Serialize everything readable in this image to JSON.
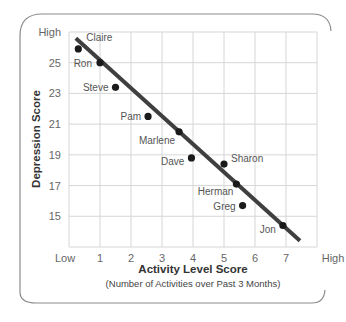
{
  "chart_data": {
    "type": "scatter",
    "title": "",
    "xlabel": "Activity Level Score",
    "xlabel_sub": "(Number of Activities over Past 3 Months)",
    "ylabel": "Depression Score",
    "x_ticks": [
      {
        "value": 0,
        "label": "Low"
      },
      {
        "value": 1,
        "label": "1"
      },
      {
        "value": 2,
        "label": "2"
      },
      {
        "value": 3,
        "label": "3"
      },
      {
        "value": 4,
        "label": "4"
      },
      {
        "value": 5,
        "label": "5"
      },
      {
        "value": 6,
        "label": "6"
      },
      {
        "value": 7,
        "label": "7"
      },
      {
        "value": 8,
        "label": "High"
      }
    ],
    "y_ticks": [
      {
        "value": 15,
        "label": "15"
      },
      {
        "value": 17,
        "label": "17"
      },
      {
        "value": 19,
        "label": "19"
      },
      {
        "value": 21,
        "label": "21"
      },
      {
        "value": 23,
        "label": "23"
      },
      {
        "value": 25,
        "label": "25"
      },
      {
        "value": 27,
        "label": "High"
      }
    ],
    "xlim": [
      0,
      8
    ],
    "ylim": [
      13,
      27
    ],
    "grid": true,
    "legend": null,
    "points": [
      {
        "name": "Claire",
        "x": 0.3,
        "y": 25.9,
        "label_dx": 8,
        "label_dy": -8,
        "anchor": "start"
      },
      {
        "name": "Ron",
        "x": 1.0,
        "y": 25.0,
        "label_dx": -8,
        "label_dy": 4,
        "anchor": "end"
      },
      {
        "name": "Steve",
        "x": 1.5,
        "y": 23.4,
        "label_dx": -7,
        "label_dy": 4,
        "anchor": "end"
      },
      {
        "name": "Pam",
        "x": 2.55,
        "y": 21.5,
        "label_dx": -7,
        "label_dy": 4,
        "anchor": "end"
      },
      {
        "name": "Marlene",
        "x": 3.55,
        "y": 20.5,
        "label_dx": -4,
        "label_dy": 12,
        "anchor": "end"
      },
      {
        "name": "Dave",
        "x": 3.95,
        "y": 18.8,
        "label_dx": -7,
        "label_dy": 7,
        "anchor": "end"
      },
      {
        "name": "Sharon",
        "x": 5.0,
        "y": 18.4,
        "label_dx": 7,
        "label_dy": -2,
        "anchor": "start"
      },
      {
        "name": "Herman",
        "x": 5.4,
        "y": 17.1,
        "label_dx": -3,
        "label_dy": 11,
        "anchor": "end"
      },
      {
        "name": "Greg",
        "x": 5.6,
        "y": 15.7,
        "label_dx": -7,
        "label_dy": 4,
        "anchor": "end"
      },
      {
        "name": "Jon",
        "x": 6.9,
        "y": 14.4,
        "label_dx": -7,
        "label_dy": 7,
        "anchor": "end"
      }
    ],
    "trend_line": {
      "x1": 0.22,
      "y1": 26.6,
      "x2": 7.45,
      "y2": 13.4
    }
  },
  "colors": {
    "frame": "#8c8c8c",
    "grid": "#d6d6d6",
    "point": "#1a1a1a",
    "trend_line": "#3f3f3f"
  }
}
